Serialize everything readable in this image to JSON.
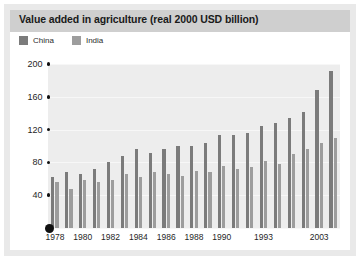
{
  "chart_data": {
    "type": "bar",
    "title": "Value added in agriculture (real 2000 USD billion)",
    "xlabel": "",
    "ylabel": "",
    "ylim": [
      0,
      200
    ],
    "yticks": [
      0,
      40,
      80,
      120,
      160,
      200
    ],
    "grid": true,
    "legend_position": "top-left",
    "categories": [
      "1978",
      "1979",
      "1980",
      "1981",
      "1982",
      "1983",
      "1984",
      "1985",
      "1986",
      "1987",
      "1988",
      "1989",
      "1990",
      "1991",
      "1992",
      "1993",
      "1994",
      "1995",
      "1996",
      "2003",
      "2004"
    ],
    "xtick_labels": [
      "1978",
      "1980",
      "1982",
      "1984",
      "1986",
      "1988",
      "1990",
      "1993",
      "2003"
    ],
    "series": [
      {
        "name": "China",
        "color": "#7b7b7b",
        "values": [
          62,
          68,
          66,
          72,
          80,
          88,
          96,
          92,
          96,
          100,
          100,
          104,
          114,
          114,
          116,
          124,
          128,
          134,
          142,
          168,
          192
        ]
      },
      {
        "name": "India",
        "color": "#9d9d9d",
        "values": [
          56,
          48,
          58,
          56,
          58,
          66,
          62,
          68,
          66,
          64,
          70,
          68,
          76,
          72,
          74,
          82,
          78,
          90,
          96,
          104,
          110
        ]
      }
    ]
  },
  "legend": {
    "china_label": "China",
    "india_label": "India"
  },
  "colors": {
    "china": "#7b7b7b",
    "india": "#9d9d9d",
    "title_band": "#cfcfcf",
    "plot_bg": "#ededed",
    "mat": "#e9e9e9"
  }
}
